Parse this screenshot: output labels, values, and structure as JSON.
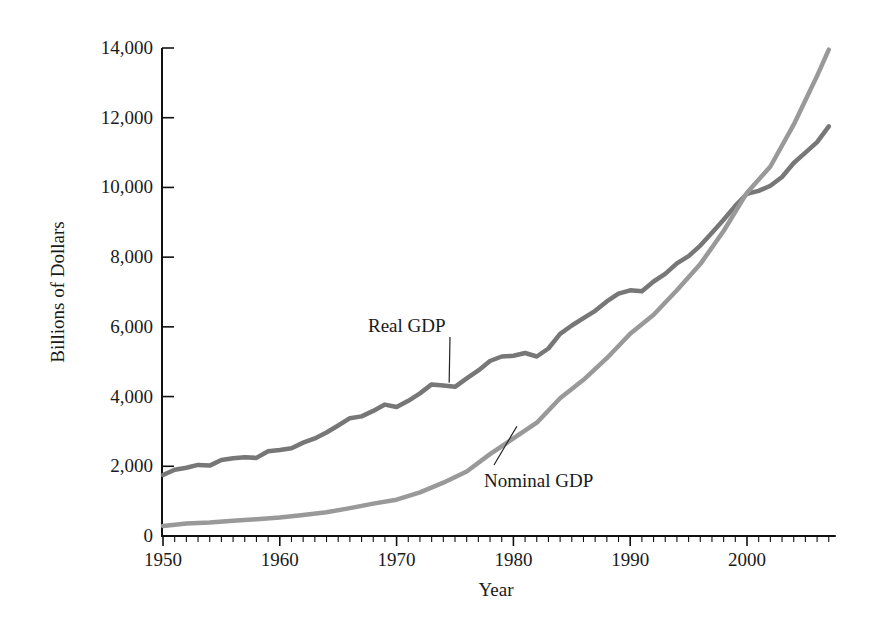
{
  "chart_data": {
    "type": "line",
    "title": "",
    "xlabel": "Year",
    "ylabel": "Billions of Dollars",
    "xlim": [
      1950,
      2007
    ],
    "ylim": [
      0,
      14000
    ],
    "grid": false,
    "legend": "none (inline annotations)",
    "x_ticks": [
      1950,
      1960,
      1970,
      1980,
      1990,
      2000
    ],
    "x_tick_labels": [
      "1950",
      "1960",
      "1970",
      "1980",
      "1990",
      "2000"
    ],
    "y_ticks": [
      0,
      2000,
      4000,
      6000,
      8000,
      10000,
      12000,
      14000
    ],
    "y_tick_labels": [
      "0",
      "2,000",
      "4,000",
      "6,000",
      "8,000",
      "10,000",
      "12,000",
      "14,000"
    ],
    "series": [
      {
        "name": "Real GDP",
        "color": "#777777",
        "annotation": {
          "text": "Real GDP",
          "x_year": 1974.5,
          "y_value": 4400,
          "label_x": 368,
          "label_y": 332
        },
        "x": [
          1950,
          1951,
          1952,
          1953,
          1954,
          1955,
          1956,
          1957,
          1958,
          1959,
          1960,
          1961,
          1962,
          1963,
          1964,
          1965,
          1966,
          1967,
          1968,
          1969,
          1970,
          1971,
          1972,
          1973,
          1974,
          1975,
          1976,
          1977,
          1978,
          1979,
          1980,
          1981,
          1982,
          1983,
          1984,
          1985,
          1986,
          1987,
          1988,
          1989,
          1990,
          1991,
          1992,
          1993,
          1994,
          1995,
          1996,
          1997,
          1998,
          1999,
          2000,
          2001,
          2002,
          2003,
          2004,
          2005,
          2006,
          2007
        ],
        "values": [
          1750,
          1900,
          1960,
          2040,
          2020,
          2180,
          2230,
          2260,
          2240,
          2430,
          2470,
          2520,
          2680,
          2800,
          2970,
          3170,
          3380,
          3430,
          3590,
          3770,
          3700,
          3880,
          4090,
          4350,
          4320,
          4280,
          4520,
          4750,
          5020,
          5150,
          5170,
          5250,
          5150,
          5380,
          5800,
          6040,
          6250,
          6460,
          6730,
          6950,
          7050,
          7020,
          7300,
          7520,
          7820,
          8030,
          8330,
          8700,
          9070,
          9470,
          9820,
          9900,
          10050,
          10300,
          10700,
          11000,
          11300,
          11750
        ]
      },
      {
        "name": "Nominal GDP",
        "color": "#999999",
        "annotation": {
          "text": "Nominal GDP",
          "x_year": 1980.3,
          "y_value": 3150,
          "label_x": 484,
          "label_y": 487
        },
        "x": [
          1950,
          1952,
          1954,
          1956,
          1958,
          1960,
          1962,
          1964,
          1966,
          1968,
          1970,
          1972,
          1974,
          1976,
          1978,
          1980,
          1982,
          1984,
          1986,
          1988,
          1990,
          1992,
          1994,
          1996,
          1998,
          2000,
          2002,
          2004,
          2005,
          2006,
          2007
        ],
        "values": [
          290,
          360,
          390,
          440,
          480,
          530,
          600,
          680,
          800,
          930,
          1040,
          1250,
          1530,
          1850,
          2350,
          2800,
          3250,
          3950,
          4480,
          5100,
          5800,
          6350,
          7050,
          7800,
          8750,
          9850,
          10600,
          11800,
          12500,
          13200,
          13950
        ]
      }
    ]
  },
  "axes": {
    "x_title": "Year",
    "y_title": "Billions of Dollars"
  },
  "annotations": {
    "real_gdp": "Real GDP",
    "nominal_gdp": "Nominal GDP"
  }
}
